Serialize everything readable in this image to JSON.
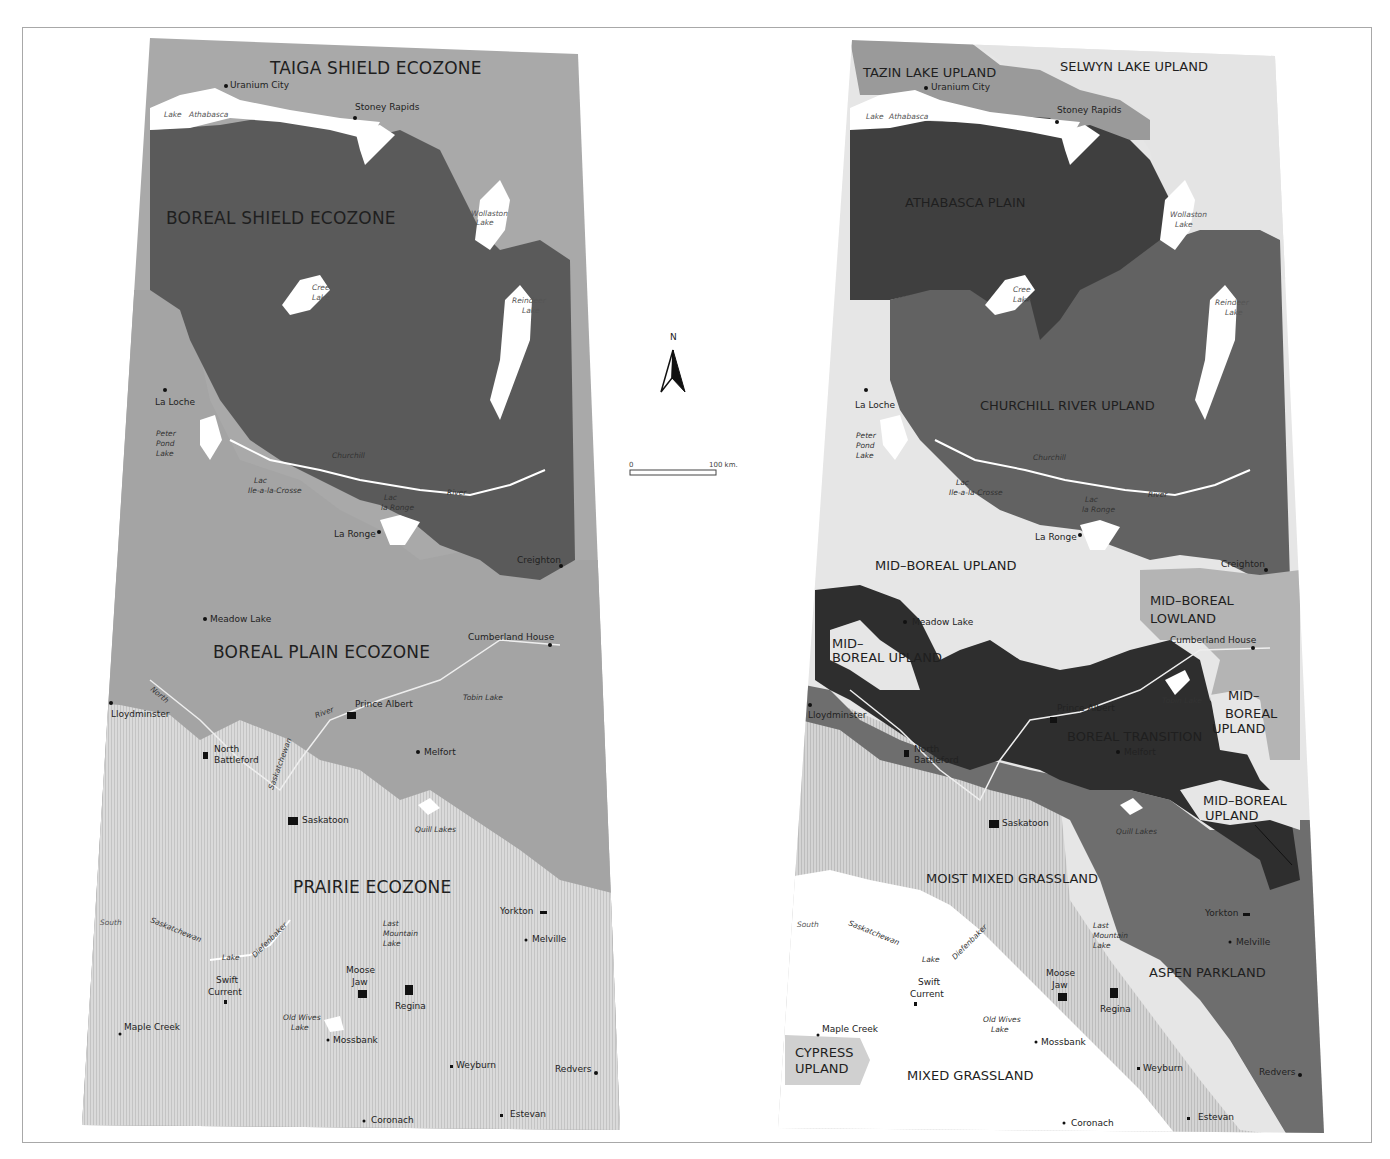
{
  "colors": {
    "taiga_shield": "#a9a9a9",
    "boreal_shield": "#5a5a5a",
    "boreal_plain": "#a4a4a4",
    "prairie": "#d6d6d6",
    "lake": "#ffffff",
    "selwyn_lake_upland": "#e4e4e4",
    "tazin_lake_upland": "#9a9a9a",
    "athabasca_plain": "#3f3f3f",
    "churchill_river_upland": "#626262",
    "mid_boreal_upland": "#e6e6e6",
    "mid_boreal_lowland": "#b4b4b4",
    "boreal_transition": "#2e2e2e",
    "aspen_parkland": "#6e6e6e",
    "moist_mixed_grassland": "#b7b7b7",
    "mixed_grassland": "#ffffff",
    "cypress_upland": "#d0d0d0",
    "frame": "#a8a8a8"
  },
  "left_map": {
    "zones": [
      {
        "name": "TAIGA SHIELD ECOZONE"
      },
      {
        "name": "BOREAL SHIELD ECOZONE"
      },
      {
        "name": "BOREAL PLAIN ECOZONE"
      },
      {
        "name": "PRAIRIE ECOZONE"
      }
    ],
    "cities": [
      {
        "name": "Uranium City"
      },
      {
        "name": "Stoney Rapids"
      },
      {
        "name": "La Loche"
      },
      {
        "name": "La Ronge"
      },
      {
        "name": "Creighton"
      },
      {
        "name": "Meadow Lake"
      },
      {
        "name": "Cumberland House"
      },
      {
        "name": "Lloydminster"
      },
      {
        "name": "Prince  Albert"
      },
      {
        "name": "North"
      },
      {
        "name": "Battleford"
      },
      {
        "name": "Melfort"
      },
      {
        "name": "Saskatoon"
      },
      {
        "name": "Yorkton"
      },
      {
        "name": "Melville"
      },
      {
        "name": "Swift"
      },
      {
        "name": "Current"
      },
      {
        "name": "Moose"
      },
      {
        "name": "Jaw"
      },
      {
        "name": "Regina"
      },
      {
        "name": "Maple Creek"
      },
      {
        "name": "Mossbank"
      },
      {
        "name": "Weyburn"
      },
      {
        "name": "Redvers"
      },
      {
        "name": "Coronach"
      },
      {
        "name": "Estevan"
      }
    ],
    "water": [
      {
        "name": "Lake"
      },
      {
        "name": "Athabasca"
      },
      {
        "name": "Wollaston"
      },
      {
        "name": "Lake"
      },
      {
        "name": "Cree"
      },
      {
        "name": "Lake"
      },
      {
        "name": "Reindeer"
      },
      {
        "name": "Lake"
      },
      {
        "name": "Peter"
      },
      {
        "name": "Pond"
      },
      {
        "name": "Lake"
      },
      {
        "name": "Churchill"
      },
      {
        "name": "Lac"
      },
      {
        "name": "Ile-a-la-Crosse"
      },
      {
        "name": "River"
      },
      {
        "name": "Lac"
      },
      {
        "name": "la Ronge"
      },
      {
        "name": "North"
      },
      {
        "name": "River"
      },
      {
        "name": "Saskatchewan"
      },
      {
        "name": "Tobin Lake"
      },
      {
        "name": "Quill Lakes"
      },
      {
        "name": "South"
      },
      {
        "name": "Saskatchewan"
      },
      {
        "name": "Lake"
      },
      {
        "name": "Diefenbaker"
      },
      {
        "name": "Last"
      },
      {
        "name": "Mountain"
      },
      {
        "name": "Lake"
      },
      {
        "name": "Old Wives"
      },
      {
        "name": "Lake"
      }
    ]
  },
  "right_map": {
    "zones": [
      {
        "name": "TAZIN LAKE UPLAND"
      },
      {
        "name": "SELWYN LAKE UPLAND"
      },
      {
        "name": "ATHABASCA PLAIN"
      },
      {
        "name": "CHURCHILL RIVER UPLAND"
      },
      {
        "name": "MID–BOREAL UPLAND"
      },
      {
        "name": "MID–BOREAL"
      },
      {
        "name": "LOWLAND"
      },
      {
        "name": "MID–"
      },
      {
        "name": "BOREAL UPLAND"
      },
      {
        "name": "MID–"
      },
      {
        "name": "BOREAL"
      },
      {
        "name": "UPLAND"
      },
      {
        "name": "BOREAL TRANSITION"
      },
      {
        "name": "MID–BOREAL"
      },
      {
        "name": "UPLAND"
      },
      {
        "name": "MOIST MIXED GRASSLAND"
      },
      {
        "name": "ASPEN PARKLAND"
      },
      {
        "name": "CYPRESS"
      },
      {
        "name": "UPLAND"
      },
      {
        "name": "MIXED GRASSLAND"
      }
    ],
    "cities": [
      {
        "name": "Uranium City"
      },
      {
        "name": "Stoney Rapids"
      },
      {
        "name": "La Loche"
      },
      {
        "name": "La Ronge"
      },
      {
        "name": "Creighton"
      },
      {
        "name": "Meadow Lake"
      },
      {
        "name": "Cumberland House"
      },
      {
        "name": "Lloydminster"
      },
      {
        "name": "Prince  Albert"
      },
      {
        "name": "North"
      },
      {
        "name": "Battleford"
      },
      {
        "name": "Melfort"
      },
      {
        "name": "Saskatoon"
      },
      {
        "name": "Yorkton"
      },
      {
        "name": "Melville"
      },
      {
        "name": "Swift"
      },
      {
        "name": "Current"
      },
      {
        "name": "Moose"
      },
      {
        "name": "Jaw"
      },
      {
        "name": "Regina"
      },
      {
        "name": "Maple Creek"
      },
      {
        "name": "Mossbank"
      },
      {
        "name": "Weyburn"
      },
      {
        "name": "Redvers"
      },
      {
        "name": "Coronach"
      },
      {
        "name": "Estevan"
      }
    ],
    "water": [
      {
        "name": "Lake"
      },
      {
        "name": "Athabasca"
      },
      {
        "name": "Wollaston"
      },
      {
        "name": "Lake"
      },
      {
        "name": "Cree"
      },
      {
        "name": "Lake"
      },
      {
        "name": "Reindeer"
      },
      {
        "name": "Lake"
      },
      {
        "name": "Peter"
      },
      {
        "name": "Pond"
      },
      {
        "name": "Lake"
      },
      {
        "name": "Churchill"
      },
      {
        "name": "Lac"
      },
      {
        "name": "Ile-a-la-Crosse"
      },
      {
        "name": "River"
      },
      {
        "name": "Lac"
      },
      {
        "name": "la Ronge"
      },
      {
        "name": "Tobin Lake"
      },
      {
        "name": "Quill Lakes"
      },
      {
        "name": "South"
      },
      {
        "name": "Saskatchewan"
      },
      {
        "name": "Lake"
      },
      {
        "name": "Diefenbaker"
      },
      {
        "name": "Last"
      },
      {
        "name": "Mountain"
      },
      {
        "name": "Lake"
      },
      {
        "name": "Old Wives"
      },
      {
        "name": "Lake"
      }
    ]
  },
  "compass": {
    "label": "N"
  },
  "scale_bar": {
    "start": "0",
    "end": "100 km."
  }
}
